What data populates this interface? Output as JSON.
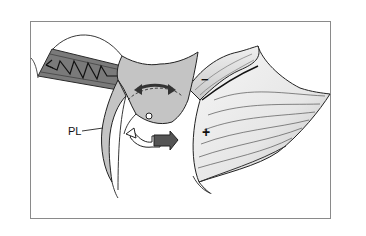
{
  "figure": {
    "labels": {
      "pl": "PL",
      "minus": "−",
      "plus": "+"
    },
    "colors": {
      "frame": "#8a8a8a",
      "background": "#ffffff",
      "muscle_band": "#7a7a7a",
      "muscle_band_edge": "#3a3a3a",
      "central_body": "#c4c4c4",
      "leaflet_fill": "#ececec",
      "outline": "#222222",
      "arrow_dark": "#555555",
      "arrow_light": "#ffffff"
    },
    "icons": {
      "spring": "zigzag-spring-icon",
      "double_arrow": "double-headed-arrow-icon",
      "rotation_arrow": "rotation-arrow-icon",
      "pivot": "pivot-point-icon"
    }
  }
}
